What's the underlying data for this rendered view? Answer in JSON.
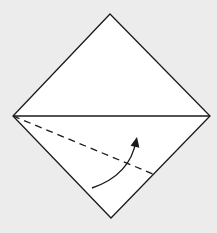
{
  "diagram": {
    "type": "origami-fold-step",
    "colors": {
      "background": "#ececec",
      "paper": "#ffffff",
      "stroke": "#1a1a1a"
    },
    "shapes": {
      "diamond": {
        "top": [
          110,
          14
        ],
        "right": [
          210,
          116
        ],
        "bottom": [
          111,
          218
        ],
        "left": [
          13,
          116
        ]
      },
      "center_fold_line": {
        "from": [
          13,
          116
        ],
        "to": [
          210,
          116
        ],
        "style": "solid"
      },
      "valley_fold_line": {
        "from": [
          13,
          116
        ],
        "to": [
          153,
          174
        ],
        "style": "dashed"
      },
      "fold_arrow": {
        "start": [
          92,
          188
        ],
        "control": [
          130,
          175
        ],
        "end": [
          136,
          141
        ],
        "head_tip": [
          137,
          137
        ],
        "direction": "up"
      }
    }
  }
}
